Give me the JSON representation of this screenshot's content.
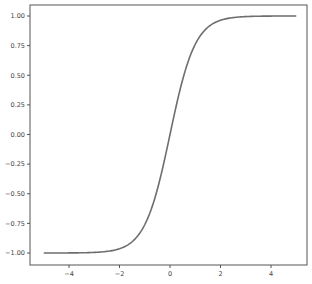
{
  "chart_data": {
    "type": "line",
    "title": "",
    "xlabel": "",
    "ylabel": "",
    "xlim": [
      -5.5,
      5.5
    ],
    "ylim": [
      -1.1,
      1.1
    ],
    "grid": false,
    "legend": null,
    "function": "tanh(x)",
    "x_ticks": [
      -4,
      -2,
      0,
      2,
      4
    ],
    "x_tick_labels": [
      "−4",
      "−2",
      "0",
      "2",
      "4"
    ],
    "y_ticks": [
      -1.0,
      -0.75,
      -0.5,
      -0.25,
      0.0,
      0.25,
      0.5,
      0.75,
      1.0
    ],
    "y_tick_labels": [
      "−1.00",
      "−0.75",
      "−0.50",
      "−0.25",
      "0.00",
      "0.25",
      "0.50",
      "0.75",
      "1.00"
    ],
    "series": [
      {
        "name": "tanh",
        "color": "#6e6e6e",
        "x": [
          -5,
          -4,
          -3,
          -2.5,
          -2,
          -1.5,
          -1,
          -0.5,
          0,
          0.5,
          1,
          1.5,
          2,
          2.5,
          3,
          4,
          5
        ],
        "y": [
          -0.9999,
          -0.9993,
          -0.9951,
          -0.9866,
          -0.964,
          -0.9051,
          -0.7616,
          -0.4621,
          0.0,
          0.4621,
          0.7616,
          0.9051,
          0.964,
          0.9866,
          0.9951,
          0.9993,
          0.9999
        ]
      }
    ]
  },
  "colors": {
    "axis": "#555555",
    "line": "#6e6e6e",
    "text": "#444444",
    "background": "#ffffff"
  }
}
